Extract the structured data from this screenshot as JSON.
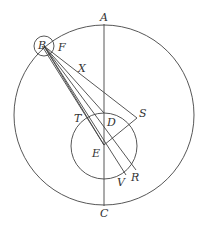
{
  "diagram": {
    "type": "geometry-figure",
    "labels": {
      "A": "A",
      "B": "B",
      "C": "C",
      "D": "D",
      "E": "E",
      "F": "F",
      "R": "R",
      "S": "S",
      "T": "T",
      "V": "V",
      "X": "X"
    },
    "colors": {
      "stroke": "#444444",
      "text": "#333333",
      "background": "#ffffff"
    }
  }
}
